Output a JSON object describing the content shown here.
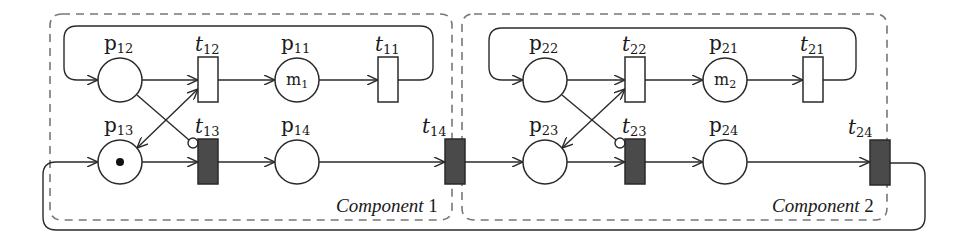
{
  "diagram": {
    "type": "petri-net",
    "colors": {
      "stroke": "#2a2a2a",
      "timed_transition_fill": "#4a4a4a",
      "immediate_transition_fill": "#ffffff",
      "component_border": "#777777"
    },
    "components": [
      {
        "id": "c1",
        "label": "Component",
        "number": "1"
      },
      {
        "id": "c2",
        "label": "Component",
        "number": "2"
      }
    ],
    "places": {
      "p12": {
        "base": "p",
        "sub": "12",
        "inner": "",
        "tokens": 0
      },
      "p11": {
        "base": "p",
        "sub": "11",
        "inner_base": "m",
        "inner_sub": "1",
        "tokens": 0
      },
      "p13": {
        "base": "p",
        "sub": "13",
        "inner": "",
        "tokens": 1
      },
      "p14": {
        "base": "p",
        "sub": "14",
        "inner": "",
        "tokens": 0
      },
      "p22": {
        "base": "p",
        "sub": "22",
        "inner": "",
        "tokens": 0
      },
      "p21": {
        "base": "p",
        "sub": "21",
        "inner_base": "m",
        "inner_sub": "2",
        "tokens": 0
      },
      "p23": {
        "base": "p",
        "sub": "23",
        "inner": "",
        "tokens": 0
      },
      "p24": {
        "base": "p",
        "sub": "24",
        "inner": "",
        "tokens": 0
      }
    },
    "transitions": {
      "t12": {
        "base": "t",
        "sub": "12",
        "kind": "immediate"
      },
      "t11": {
        "base": "t",
        "sub": "11",
        "kind": "immediate"
      },
      "t13": {
        "base": "t",
        "sub": "13",
        "kind": "timed"
      },
      "t14": {
        "base": "t",
        "sub": "14",
        "kind": "timed"
      },
      "t22": {
        "base": "t",
        "sub": "22",
        "kind": "immediate"
      },
      "t21": {
        "base": "t",
        "sub": "21",
        "kind": "immediate"
      },
      "t23": {
        "base": "t",
        "sub": "23",
        "kind": "timed"
      },
      "t24": {
        "base": "t",
        "sub": "24",
        "kind": "timed"
      }
    },
    "arcs": [
      {
        "from": "p12",
        "to": "t12",
        "type": "normal"
      },
      {
        "from": "t12",
        "to": "p11",
        "type": "normal"
      },
      {
        "from": "p11",
        "to": "t11",
        "type": "normal"
      },
      {
        "from": "t11",
        "to": "p12",
        "type": "normal"
      },
      {
        "from": "p13",
        "to": "t12",
        "type": "bidirectional"
      },
      {
        "from": "p12",
        "to": "t13",
        "type": "inhibitor"
      },
      {
        "from": "p13",
        "to": "t13",
        "type": "normal"
      },
      {
        "from": "t13",
        "to": "p14",
        "type": "normal"
      },
      {
        "from": "p14",
        "to": "t14",
        "type": "normal"
      },
      {
        "from": "t14",
        "to": "p23",
        "type": "normal"
      },
      {
        "from": "p22",
        "to": "t22",
        "type": "normal"
      },
      {
        "from": "t22",
        "to": "p21",
        "type": "normal"
      },
      {
        "from": "p21",
        "to": "t21",
        "type": "normal"
      },
      {
        "from": "t21",
        "to": "p22",
        "type": "normal"
      },
      {
        "from": "p23",
        "to": "t22",
        "type": "bidirectional"
      },
      {
        "from": "p22",
        "to": "t23",
        "type": "inhibitor"
      },
      {
        "from": "p23",
        "to": "t23",
        "type": "normal"
      },
      {
        "from": "t23",
        "to": "p24",
        "type": "normal"
      },
      {
        "from": "p24",
        "to": "t24",
        "type": "normal"
      },
      {
        "from": "t24",
        "to": "p13",
        "type": "normal"
      }
    ]
  }
}
